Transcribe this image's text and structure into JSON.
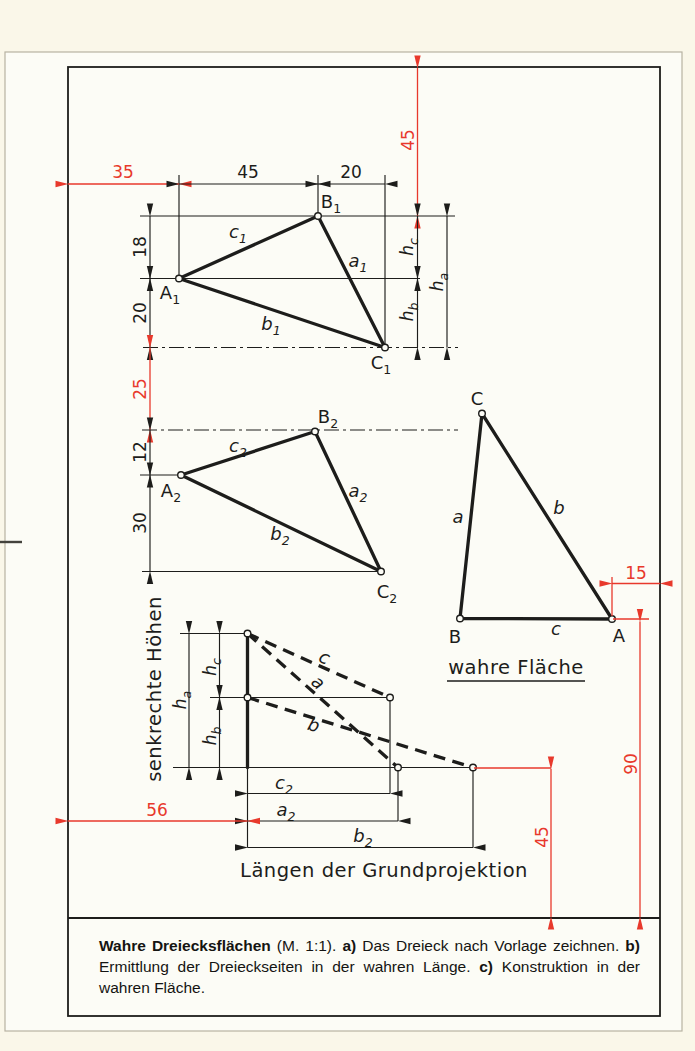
{
  "palette": {
    "ink": "#1d1d1b",
    "red": "#e8392c",
    "paper": "#faf7e9",
    "page": "#fcfcf6"
  },
  "view1": {
    "dim_offset_left": "35",
    "dim_ab_horizontal": "45",
    "dim_bc_horizontal": "20",
    "dim_offset_top": "45",
    "dim_ab_vertical": "18",
    "dim_ac_vertical": "20",
    "vertex_a": {
      "base": "A",
      "sub": "1"
    },
    "vertex_b": {
      "base": "B",
      "sub": "1"
    },
    "vertex_c": {
      "base": "C",
      "sub": "1"
    },
    "side_a": {
      "base": "a",
      "sub": "1"
    },
    "side_b": {
      "base": "b",
      "sub": "1"
    },
    "side_c": {
      "base": "c",
      "sub": "1"
    },
    "height_a": {
      "base": "h",
      "sub": "a"
    },
    "height_b": {
      "base": "h",
      "sub": "b"
    },
    "height_c": {
      "base": "h",
      "sub": "c"
    }
  },
  "view2": {
    "dim_offset_vertical": "25",
    "dim_ab_vertical": "12",
    "dim_ac_vertical": "30",
    "vertex_a": {
      "base": "A",
      "sub": "2"
    },
    "vertex_b": {
      "base": "B",
      "sub": "2"
    },
    "vertex_c": {
      "base": "C",
      "sub": "2"
    },
    "side_a": {
      "base": "a",
      "sub": "2"
    },
    "side_b": {
      "base": "b",
      "sub": "2"
    },
    "side_c": {
      "base": "c",
      "sub": "2"
    }
  },
  "true_face": {
    "vertex_a": "A",
    "vertex_b": "B",
    "vertex_c": "C",
    "side_a": "a",
    "side_b": "b",
    "side_c": "c",
    "dim_offset_right": "15",
    "dim_height": "90",
    "label": "wahre Fläche"
  },
  "construction": {
    "axis_label": "senkrechte Höhen",
    "base_label": "Längen der Grundprojektion",
    "height_a": {
      "base": "h",
      "sub": "a"
    },
    "height_b": {
      "base": "h",
      "sub": "b"
    },
    "height_c": {
      "base": "h",
      "sub": "c"
    },
    "hyp_a": "a",
    "hyp_b": "b",
    "hyp_c": "c",
    "len_a": {
      "base": "a",
      "sub": "2"
    },
    "len_b": {
      "base": "b",
      "sub": "2"
    },
    "len_c": {
      "base": "c",
      "sub": "2"
    },
    "dim_offset_left": "56",
    "dim_offset_bottom": "45"
  },
  "caption": {
    "title": "Wahre Dreiecksflächen",
    "scale": " (M. 1:1). ",
    "label_a": "a)",
    "text_a": " Das Dreieck nach Vorlage zeichnen. ",
    "label_b": "b)",
    "text_b": " Ermittlung der Dreieckseiten in der wahren Länge. ",
    "label_c": "c)",
    "text_c": " Konstruktion in der wahren Fläche."
  }
}
